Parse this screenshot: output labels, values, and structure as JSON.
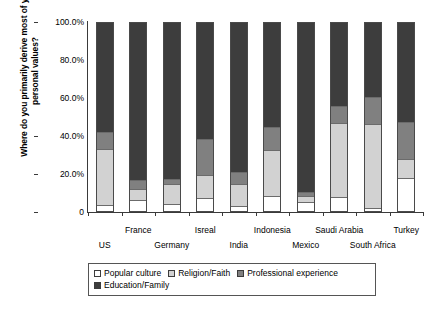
{
  "chart_data": {
    "type": "bar",
    "subtype": "stacked-100-percent",
    "title": "",
    "ylabel": "Where do you primarily derive most of your personal values?",
    "xlabel": "",
    "ylim": [
      0,
      100
    ],
    "grid": false,
    "legend_position": "bottom",
    "ytick_labels": [
      "100.0%",
      "80.0%",
      "60.0%",
      "40.0%",
      "20.0%",
      "0"
    ],
    "ytick_values": [
      100,
      80,
      60,
      40,
      20,
      0
    ],
    "categories": [
      "US",
      "France",
      "Germany",
      "Isreal",
      "India",
      "Indonesia",
      "Mexico",
      "Saudi Arabia",
      "South Africa",
      "Turkey"
    ],
    "series": [
      {
        "name": "Popular culture",
        "color": "#ffffff",
        "values": [
          3.2,
          5.8,
          3.7,
          6.8,
          2.6,
          7.9,
          4.7,
          7.4,
          1.6,
          17.4
        ]
      },
      {
        "name": "Religion/Faith",
        "color": "#d2d2d2",
        "values": [
          30.0,
          5.8,
          10.5,
          12.1,
          11.6,
          24.7,
          3.2,
          39.5,
          44.7,
          10.5
        ]
      },
      {
        "name": "Professional experience",
        "color": "#808080",
        "values": [
          8.9,
          4.7,
          2.6,
          19.5,
          6.8,
          12.1,
          2.1,
          8.9,
          14.2,
          19.5
        ]
      },
      {
        "name": "Education/Family",
        "color": "#3d3d3d",
        "values": [
          57.9,
          83.7,
          83.2,
          61.6,
          79.0,
          55.3,
          90.0,
          44.2,
          39.5,
          52.6
        ]
      }
    ]
  },
  "legend": {
    "items": [
      {
        "label": "Popular culture",
        "color": "#ffffff"
      },
      {
        "label": "Religion/Faith",
        "color": "#d2d2d2"
      },
      {
        "label": "Professional experience",
        "color": "#808080"
      },
      {
        "label": "Education/Family",
        "color": "#3d3d3d"
      }
    ]
  },
  "axis": {
    "y_title": "Where do you primarily derive most of your personal values?"
  }
}
